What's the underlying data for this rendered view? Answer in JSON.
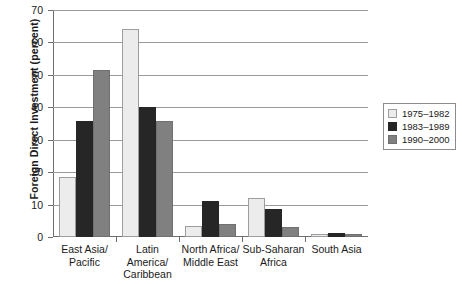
{
  "chart_data": {
    "type": "bar",
    "title": "",
    "xlabel": "",
    "ylabel": "Foreign Direct Investment (percent)",
    "ylim": [
      0,
      70
    ],
    "ytick_labels": [
      "0",
      "10",
      "20",
      "30",
      "40",
      "50",
      "60",
      "70"
    ],
    "ytick_values": [
      0,
      10,
      20,
      30,
      40,
      50,
      60,
      70
    ],
    "grid": true,
    "legend_position": "right",
    "categories": [
      "East Asia/\nPacific",
      "Latin\nAmerica/\nCaribbean",
      "North Africa/\nMiddle East",
      "Sub-Saharan\nAfrica",
      "South Asia"
    ],
    "category_lines": [
      [
        "East Asia/",
        "Pacific"
      ],
      [
        "Latin",
        "America/",
        "Caribbean"
      ],
      [
        "North Africa/",
        "Middle East"
      ],
      [
        "Sub-Saharan",
        "Africa"
      ],
      [
        "South Asia"
      ]
    ],
    "series": [
      {
        "name": "1975–1982",
        "color": "#ececec",
        "values": [
          18.5,
          64.0,
          3.5,
          12.0,
          1.0
        ]
      },
      {
        "name": "1983–1989",
        "color": "#262626",
        "values": [
          35.7,
          40.2,
          11.2,
          8.5,
          1.2
        ]
      },
      {
        "name": "1990–2000",
        "color": "#808080",
        "values": [
          51.5,
          35.8,
          4.0,
          3.0,
          1.0
        ]
      }
    ]
  }
}
